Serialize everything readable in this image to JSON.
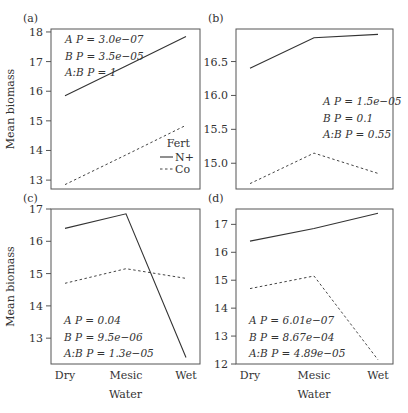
{
  "chart_data": [
    {
      "type": "line",
      "panel_label": "(a)",
      "categories": [
        "Dry",
        "Mesic",
        "Wet"
      ],
      "xlabel": "",
      "ylabel": "Mean biomass",
      "ylim": [
        12.7,
        18.1
      ],
      "yticks": [
        13,
        14,
        15,
        16,
        17,
        18
      ],
      "show_x_ticklabels": false,
      "series": [
        {
          "name": "N+",
          "style": "solid",
          "values": [
            15.85,
            16.85,
            17.85
          ]
        },
        {
          "name": "Co",
          "style": "dashed",
          "values": [
            12.85,
            13.85,
            14.85
          ]
        }
      ],
      "annotation": [
        "A P = 3.0e−07",
        "B P = 3.5e−05",
        "A:B P = 1"
      ],
      "annotation_position": "top-left",
      "legend": {
        "title": "Fert",
        "entries": [
          "N+",
          "Co"
        ],
        "position": "bottom-right"
      }
    },
    {
      "type": "line",
      "panel_label": "(b)",
      "categories": [
        "Dry",
        "Mesic",
        "Wet"
      ],
      "xlabel": "",
      "ylabel": "",
      "ylim": [
        14.62,
        16.98
      ],
      "yticks": [
        15.0,
        15.5,
        16.0,
        16.5
      ],
      "ytick_labels": [
        "15.0",
        "15.5",
        "16.0",
        "16.5"
      ],
      "show_x_ticklabels": false,
      "series": [
        {
          "name": "N+",
          "style": "solid",
          "values": [
            16.4,
            16.85,
            16.9
          ]
        },
        {
          "name": "Co",
          "style": "dashed",
          "values": [
            14.7,
            15.15,
            14.85
          ]
        }
      ],
      "annotation": [
        "A P = 1.5e−05",
        "B P = 0.1",
        "A:B P = 0.55"
      ],
      "annotation_position": "middle-right"
    },
    {
      "type": "line",
      "panel_label": "(c)",
      "categories": [
        "Dry",
        "Mesic",
        "Wet"
      ],
      "xlabel": "Water",
      "ylabel": "Mean biomass",
      "ylim": [
        12.2,
        17.0
      ],
      "yticks": [
        13,
        14,
        15,
        16,
        17
      ],
      "show_x_ticklabels": true,
      "series": [
        {
          "name": "N+",
          "style": "solid",
          "values": [
            16.4,
            16.85,
            12.4
          ]
        },
        {
          "name": "Co",
          "style": "dashed",
          "values": [
            14.7,
            15.15,
            14.85
          ]
        }
      ],
      "annotation": [
        "A P = 0.04",
        "B P = 9.5e−06",
        "A:B P = 1.3e−05"
      ],
      "annotation_position": "bottom-left"
    },
    {
      "type": "line",
      "panel_label": "(d)",
      "categories": [
        "Dry",
        "Mesic",
        "Wet"
      ],
      "xlabel": "Water",
      "ylabel": "",
      "ylim": [
        12.0,
        17.55
      ],
      "yticks": [
        12,
        13,
        14,
        15,
        16,
        17
      ],
      "show_x_ticklabels": true,
      "series": [
        {
          "name": "N+",
          "style": "solid",
          "values": [
            16.4,
            16.85,
            17.4
          ]
        },
        {
          "name": "Co",
          "style": "dashed",
          "values": [
            14.7,
            15.15,
            12.15
          ]
        }
      ],
      "annotation": [
        "A P = 6.01e−07",
        "B P = 8.67e−04",
        "A:B P = 4.89e−05"
      ],
      "annotation_position": "bottom-left"
    }
  ]
}
